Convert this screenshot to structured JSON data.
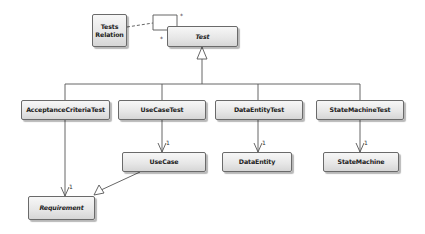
{
  "diagram": {
    "type": "UML class diagram",
    "classes": {
      "tests_relation": {
        "label": "Tests Relation",
        "line1": "Tests",
        "line2": "Relation",
        "abstract": false
      },
      "test": {
        "label": "Test",
        "abstract": true
      },
      "acceptance_criteria_test": {
        "label": "AcceptanceCriteriaTest",
        "abstract": false
      },
      "use_case_test": {
        "label": "UseCaseTest",
        "abstract": false
      },
      "data_entity_test": {
        "label": "DataEntityTest",
        "abstract": false
      },
      "state_machine_test": {
        "label": "StateMachineTest",
        "abstract": false
      },
      "use_case": {
        "label": "UseCase",
        "abstract": false
      },
      "data_entity": {
        "label": "DataEntity",
        "abstract": false
      },
      "state_machine": {
        "label": "StateMachine",
        "abstract": false
      },
      "requirement": {
        "label": "Requirement",
        "abstract": true
      }
    },
    "multiplicities": {
      "self_assoc_source": "*",
      "self_assoc_target": "*",
      "use_case_test_to_use_case": "1",
      "data_entity_test_to_data_entity": "1",
      "state_machine_test_to_state_machine": "1",
      "acceptance_to_requirement": "1"
    },
    "relationships": [
      {
        "type": "association-class",
        "from": "Tests Relation",
        "to": "Test self-association",
        "style": "dashed"
      },
      {
        "type": "association",
        "from": "Test",
        "to": "Test",
        "multiplicity": [
          "*",
          "*"
        ]
      },
      {
        "type": "generalization",
        "from": "AcceptanceCriteriaTest",
        "to": "Test"
      },
      {
        "type": "generalization",
        "from": "UseCaseTest",
        "to": "Test"
      },
      {
        "type": "generalization",
        "from": "DataEntityTest",
        "to": "Test"
      },
      {
        "type": "generalization",
        "from": "StateMachineTest",
        "to": "Test"
      },
      {
        "type": "directed-association",
        "from": "UseCaseTest",
        "to": "UseCase",
        "multiplicity": "1"
      },
      {
        "type": "directed-association",
        "from": "DataEntityTest",
        "to": "DataEntity",
        "multiplicity": "1"
      },
      {
        "type": "directed-association",
        "from": "StateMachineTest",
        "to": "StateMachine",
        "multiplicity": "1"
      },
      {
        "type": "directed-association",
        "from": "AcceptanceCriteriaTest",
        "to": "Requirement",
        "multiplicity": "1"
      },
      {
        "type": "generalization",
        "from": "UseCase",
        "to": "Requirement"
      }
    ],
    "colors": {
      "line": "#555555",
      "box_border": "#6a6a6a",
      "box_top": "#f7f7f7",
      "box_bottom": "#d6d6d6"
    }
  }
}
